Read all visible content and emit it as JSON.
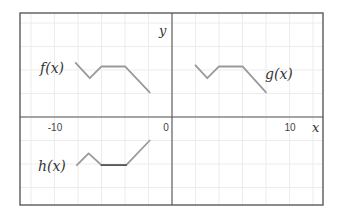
{
  "chart_data": {
    "type": "line",
    "title": "",
    "xlabel": "x",
    "ylabel": "y",
    "xlim": [
      -13,
      13
    ],
    "ylim": [
      -7.5,
      8.9
    ],
    "grid": true,
    "grid_step": 2,
    "x_tick_labels": [
      "-10",
      "0",
      "10"
    ],
    "x_ticks": [
      -10,
      0,
      10
    ],
    "series": [
      {
        "name": "f(x)",
        "points": [
          [
            -8.2,
            4.6
          ],
          [
            -7,
            3.3
          ],
          [
            -6,
            4.3
          ],
          [
            -4,
            4.3
          ],
          [
            -1.9,
            2.1
          ]
        ]
      },
      {
        "name": "g(x)",
        "points": [
          [
            2,
            4.4
          ],
          [
            3,
            3.3
          ],
          [
            4,
            4.3
          ],
          [
            6,
            4.3
          ],
          [
            8,
            2.1
          ]
        ]
      },
      {
        "name": "h(x)",
        "points": [
          [
            -8.1,
            -4.1
          ],
          [
            -7.1,
            -3.1
          ],
          [
            -6,
            -4.1
          ],
          [
            -3.9,
            -4.1
          ],
          [
            -1.9,
            -2.0
          ]
        ],
        "highlight_segment": [
          [
            -6,
            -4.1
          ],
          [
            -3.9,
            -4.1
          ]
        ]
      }
    ]
  },
  "labels": {
    "f": "f(x)",
    "g": "g(x)",
    "h": "h(x)",
    "x_axis": "x",
    "y_axis": "y",
    "tick_neg10": "-10",
    "tick_0": "0",
    "tick_10": "10"
  },
  "colors": {
    "curve": "#9a9a9a",
    "highlight": "#555555",
    "axis": "#555555",
    "grid": "#ececec"
  }
}
